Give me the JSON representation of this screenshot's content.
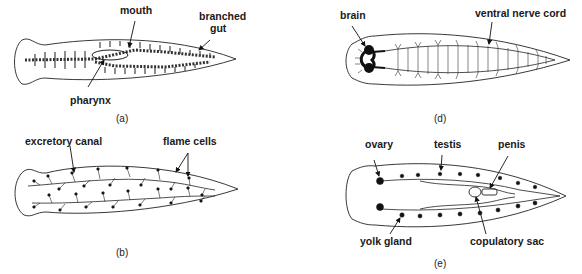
{
  "panels": [
    {
      "id": "a",
      "caption": "(a)",
      "labels": {
        "mouth": "mouth",
        "branched_gut_1": "branched",
        "branched_gut_2": "gut",
        "pharynx": "pharynx"
      }
    },
    {
      "id": "b",
      "caption": "(b)",
      "labels": {
        "excretory_canal": "excretory canal",
        "flame_cells": "flame cells"
      }
    },
    {
      "id": "d",
      "caption": "(d)",
      "labels": {
        "brain": "brain",
        "ventral_nerve_cord": "ventral nerve cord"
      }
    },
    {
      "id": "e",
      "caption": "(e)",
      "labels": {
        "ovary": "ovary",
        "testis": "testis",
        "penis": "penis",
        "yolk_gland": "yolk gland",
        "copulatory_sac": "copulatory sac"
      }
    }
  ]
}
